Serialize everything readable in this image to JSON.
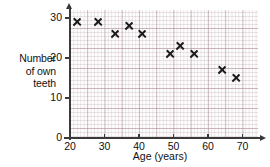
{
  "chart_data": {
    "type": "scatter",
    "title": "",
    "xlabel": "Age (years)",
    "ylabel": "Number of own teeth",
    "ylabel_lines": [
      "Number",
      "of own",
      "teeth"
    ],
    "xlim": [
      20,
      74
    ],
    "ylim": [
      0,
      32
    ],
    "xticks": [
      20,
      30,
      40,
      50,
      60,
      70
    ],
    "yticks": [
      0,
      10,
      20,
      30
    ],
    "xtick_labels": [
      "20",
      "30",
      "40",
      "50",
      "60",
      "70"
    ],
    "ytick_labels": [
      "0",
      "10",
      "20",
      "30"
    ],
    "grid": true,
    "grid_minor": true,
    "legend": "none",
    "marker": "x",
    "marker_color": "#1b1b1b",
    "grid_color": "#b49aa2",
    "axis_color": "#3a3a3a",
    "series": [
      {
        "name": "Own teeth by age",
        "points": [
          {
            "x": 22,
            "y": 29
          },
          {
            "x": 28,
            "y": 29
          },
          {
            "x": 33,
            "y": 26
          },
          {
            "x": 37,
            "y": 28
          },
          {
            "x": 41,
            "y": 26
          },
          {
            "x": 49,
            "y": 21
          },
          {
            "x": 52,
            "y": 23
          },
          {
            "x": 56,
            "y": 21
          },
          {
            "x": 64,
            "y": 17
          },
          {
            "x": 68,
            "y": 15
          }
        ]
      }
    ]
  }
}
